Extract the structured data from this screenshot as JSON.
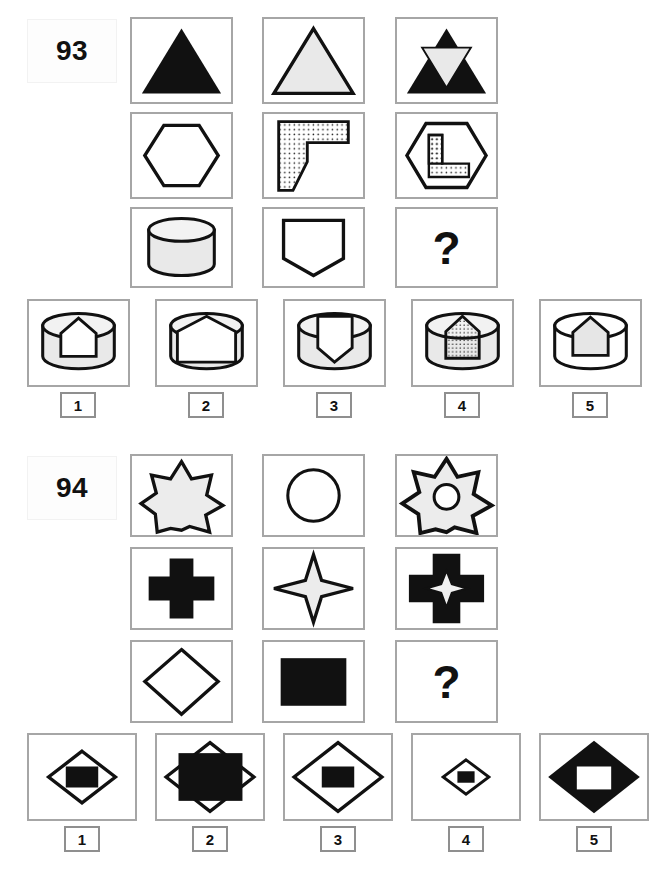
{
  "page": {
    "type": "visual-analogy-test-sheet",
    "background_color": "#ffffff",
    "frame_color": "#a6a6a6"
  },
  "puzzles": [
    {
      "id": "93",
      "number_label": "93",
      "question_mark": "?",
      "matrix": {
        "rows": 3,
        "cols": 3,
        "cells": [
          {
            "pos": "r1c1",
            "shape": "triangle",
            "fill": "black",
            "note": "solid black upward triangle"
          },
          {
            "pos": "r1c2",
            "shape": "triangle",
            "fill": "light",
            "note": "outlined light-grey upward triangle"
          },
          {
            "pos": "r1c3",
            "shape": "triangle-combo",
            "fill": "black-with-inverted-light-triangle",
            "note": "black triangle overlapped by light downward triangle"
          },
          {
            "pos": "r2c1",
            "shape": "hexagon",
            "fill": "white",
            "note": "outlined hexagon"
          },
          {
            "pos": "r2c2",
            "shape": "L-block",
            "fill": "dotted",
            "note": "dotted L / flag shaped block"
          },
          {
            "pos": "r2c3",
            "shape": "hexagon-with-L",
            "fill": "dotted-L-inside-hexagon",
            "note": "hexagon containing dotted L block"
          },
          {
            "pos": "r3c1",
            "shape": "cylinder",
            "fill": "light",
            "note": "light grey 3D cylinder"
          },
          {
            "pos": "r3c2",
            "shape": "pentagon-down",
            "fill": "white",
            "note": "outlined downward pentagon / shield"
          },
          {
            "pos": "r3c3",
            "shape": "question",
            "fill": "none",
            "note": "missing tile"
          }
        ]
      },
      "options": [
        {
          "number": "1",
          "shape": "cylinder-with-white-pentagon",
          "note": "light cylinder with white outlined pentagon inset"
        },
        {
          "number": "2",
          "shape": "cylinder-large-white-pentagon",
          "note": "cylinder with large white pentagon filling top"
        },
        {
          "number": "3",
          "shape": "cylinder-with-inverted-pentagon",
          "note": "light cylinder with white downward pentagon (shield)"
        },
        {
          "number": "4",
          "shape": "cylinder-with-dotted-pentagon",
          "note": "light cylinder with dotted pentagon inset"
        },
        {
          "number": "5",
          "shape": "cylinder-with-light-pentagon",
          "note": "outlined cylinder with light pentagon inset"
        }
      ]
    },
    {
      "id": "94",
      "number_label": "94",
      "question_mark": "?",
      "matrix": {
        "rows": 3,
        "cols": 3,
        "cells": [
          {
            "pos": "r1c1",
            "shape": "seven-point-star",
            "fill": "light",
            "note": "light grey 7-point star outline"
          },
          {
            "pos": "r1c2",
            "shape": "circle",
            "fill": "white",
            "note": "outlined circle"
          },
          {
            "pos": "r1c3",
            "shape": "star-with-circle-hole",
            "fill": "light",
            "note": "light star with circular hole"
          },
          {
            "pos": "r2c1",
            "shape": "cross",
            "fill": "black",
            "note": "solid black plus / cross"
          },
          {
            "pos": "r2c2",
            "shape": "four-point-star",
            "fill": "light",
            "note": "light 4-pointed star outline"
          },
          {
            "pos": "r2c3",
            "shape": "cross-with-star-hole",
            "fill": "black",
            "note": "black cross with 4-point star hole"
          },
          {
            "pos": "r3c1",
            "shape": "diamond",
            "fill": "white",
            "note": "outlined diamond"
          },
          {
            "pos": "r3c2",
            "shape": "rectangle",
            "fill": "black",
            "note": "solid black rectangle"
          },
          {
            "pos": "r3c3",
            "shape": "question",
            "fill": "none",
            "note": "missing tile"
          }
        ]
      },
      "options": [
        {
          "number": "1",
          "shape": "diamond-outline-with-black-rect",
          "note": "outlined diamond containing small black rectangle"
        },
        {
          "number": "2",
          "shape": "black-rect-over-diamond",
          "note": "large black rectangle overlapping outlined diamond"
        },
        {
          "number": "3",
          "shape": "large-diamond-with-black-rect",
          "note": "large outlined diamond with black rectangle inside"
        },
        {
          "number": "4",
          "shape": "small-diamond-with-black-rect",
          "note": "small outlined diamond with tiny black rectangle"
        },
        {
          "number": "5",
          "shape": "black-diamond-with-white-rect",
          "note": "solid black diamond with white rectangle hole"
        }
      ]
    }
  ]
}
